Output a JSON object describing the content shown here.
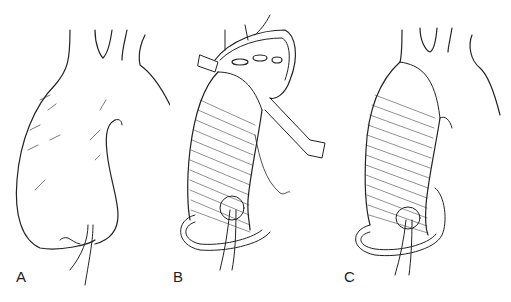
{
  "figure": {
    "panels": [
      {
        "id": "A",
        "label": "A",
        "description": "Native aneurysmal ascending aorta"
      },
      {
        "id": "B",
        "label": "B",
        "description": "Graft replacement with sewing of distal anastomosis and coronary button"
      },
      {
        "id": "C",
        "label": "C",
        "description": "Completed tube graft repair"
      }
    ],
    "colors": {
      "line": "#222222",
      "background": "#ffffff"
    }
  }
}
